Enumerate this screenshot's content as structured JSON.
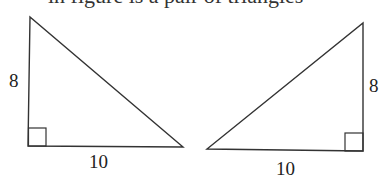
{
  "header": {
    "cut_text": "in figure is a pair of triangles"
  },
  "triangles": [
    {
      "name": "left",
      "vertical_leg_label": "8",
      "horizontal_leg_label": "10",
      "right_angle": "bottom-left"
    },
    {
      "name": "right",
      "vertical_leg_label": "8",
      "horizontal_leg_label": "10",
      "right_angle": "bottom-right"
    }
  ],
  "colors": {
    "stroke": "#333333",
    "background": "#ffffff"
  }
}
